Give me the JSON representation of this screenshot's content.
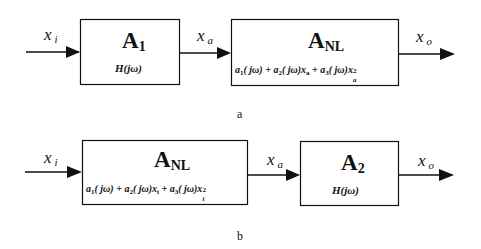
{
  "diagram_a": {
    "caption": "a",
    "input_label": {
      "var": "x",
      "sub": "i"
    },
    "mid_label": {
      "var": "x",
      "sub": "a"
    },
    "output_label": {
      "var": "x",
      "sub": "o"
    },
    "block1": {
      "title": "A",
      "title_sub": "1",
      "transfer": "H(jω)"
    },
    "block2": {
      "title": "A",
      "title_sub": "NL",
      "equation": {
        "t1": "a",
        "t1_sub": "1",
        "t1_arg": "( jω) + ",
        "t2": "a",
        "t2_sub": "2",
        "t2_arg": "( jω)x",
        "t2_var_sub": "a",
        "t3_prefix": " + ",
        "t3": "a",
        "t3_sub": "3",
        "t3_arg": "( jω)x",
        "t3_var_sub": "a",
        "t3_pow": "2"
      }
    }
  },
  "diagram_b": {
    "caption": "b",
    "input_label": {
      "var": "x",
      "sub": "i"
    },
    "mid_label": {
      "var": "x",
      "sub": "a"
    },
    "output_label": {
      "var": "x",
      "sub": "o"
    },
    "block1": {
      "title": "A",
      "title_sub": "NL",
      "equation": {
        "t1": "a",
        "t1_sub": "1",
        "t1_arg": "( jω) + ",
        "t2": "a",
        "t2_sub": "2",
        "t2_arg": "( jω)x",
        "t2_var_sub": "i",
        "t3_prefix": " + ",
        "t3": "a",
        "t3_sub": "3",
        "t3_arg": "( jω)x",
        "t3_var_sub": "i",
        "t3_pow": "2"
      }
    },
    "block2": {
      "title": "A",
      "title_sub": "2",
      "transfer": "H(jω)"
    }
  }
}
